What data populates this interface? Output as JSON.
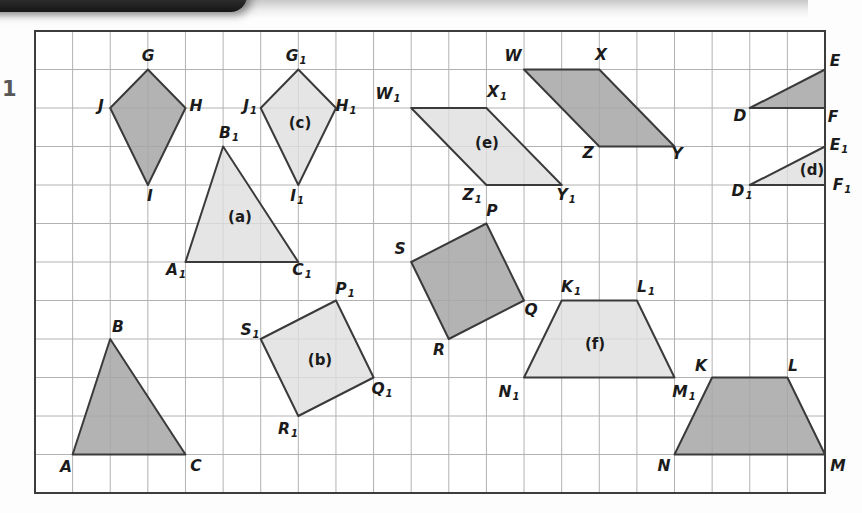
{
  "question_number": "1",
  "figure": {
    "grid": {
      "cols": 21,
      "rows": 12,
      "left": 35,
      "top": 31,
      "cell_w": 37.619,
      "cell_h": 38.5,
      "line_color": "#b2b2b2",
      "border_color": "#3c3c3c",
      "background": "#ffffff"
    },
    "colors": {
      "outline": "#3a3a3a",
      "dark_fill": "#a6a6a6",
      "dark_opacity": 0.85,
      "light_fill": "#dedede",
      "light_opacity": 0.8
    },
    "shapes": [
      {
        "id": "kite-GJHI",
        "kind": "kite",
        "role": "original",
        "fill": "dark",
        "vertices": [
          [
            3,
            1
          ],
          [
            4,
            2
          ],
          [
            3,
            4
          ],
          [
            2,
            2
          ]
        ],
        "vertex_labels": [
          {
            "text": "G",
            "sub": "",
            "x": 148,
            "y": 57
          },
          {
            "text": "H",
            "sub": "",
            "x": 196,
            "y": 107
          },
          {
            "text": "I",
            "sub": "",
            "x": 150,
            "y": 197
          },
          {
            "text": "J",
            "sub": "",
            "x": 101,
            "y": 107
          }
        ],
        "tag": null
      },
      {
        "id": "kite-G1J1H1I1",
        "kind": "kite",
        "role": "image",
        "fill": "light",
        "vertices": [
          [
            7,
            1
          ],
          [
            8,
            2
          ],
          [
            7,
            4
          ],
          [
            6,
            2
          ]
        ],
        "vertex_labels": [
          {
            "text": "G",
            "sub": "1",
            "x": 296,
            "y": 57
          },
          {
            "text": "H",
            "sub": "1",
            "x": 346,
            "y": 107
          },
          {
            "text": "I",
            "sub": "1",
            "x": 297,
            "y": 197
          },
          {
            "text": "J",
            "sub": "1",
            "x": 250,
            "y": 107
          }
        ],
        "tag": {
          "text": "(c)",
          "x": 300,
          "y": 123
        }
      },
      {
        "id": "triangle-ABC",
        "kind": "triangle",
        "role": "original",
        "fill": "dark",
        "vertices": [
          [
            1,
            11
          ],
          [
            2,
            8
          ],
          [
            4,
            11
          ]
        ],
        "vertex_labels": [
          {
            "text": "A",
            "sub": "",
            "x": 66,
            "y": 468
          },
          {
            "text": "B",
            "sub": "",
            "x": 118,
            "y": 328
          },
          {
            "text": "C",
            "sub": "",
            "x": 196,
            "y": 467
          }
        ],
        "tag": null
      },
      {
        "id": "triangle-A1B1C1",
        "kind": "triangle",
        "role": "image",
        "fill": "light",
        "vertices": [
          [
            4,
            6
          ],
          [
            5,
            3
          ],
          [
            7,
            6
          ]
        ],
        "vertex_labels": [
          {
            "text": "A",
            "sub": "1",
            "x": 176,
            "y": 271
          },
          {
            "text": "B",
            "sub": "1",
            "x": 229,
            "y": 134
          },
          {
            "text": "C",
            "sub": "1",
            "x": 302,
            "y": 271
          }
        ],
        "tag": {
          "text": "(a)",
          "x": 240,
          "y": 217
        }
      },
      {
        "id": "square-SPQR",
        "kind": "square",
        "role": "original",
        "fill": "dark",
        "vertices": [
          [
            10,
            6
          ],
          [
            12,
            5
          ],
          [
            13,
            7
          ],
          [
            11,
            8
          ]
        ],
        "vertex_labels": [
          {
            "text": "S",
            "sub": "",
            "x": 400,
            "y": 250
          },
          {
            "text": "P",
            "sub": "",
            "x": 492,
            "y": 212
          },
          {
            "text": "Q",
            "sub": "",
            "x": 531,
            "y": 311
          },
          {
            "text": "R",
            "sub": "",
            "x": 439,
            "y": 351
          }
        ],
        "tag": null
      },
      {
        "id": "square-S1P1Q1R1",
        "kind": "square",
        "role": "image",
        "fill": "light",
        "vertices": [
          [
            6,
            8
          ],
          [
            8,
            7
          ],
          [
            9,
            9
          ],
          [
            7,
            10
          ]
        ],
        "vertex_labels": [
          {
            "text": "S",
            "sub": "1",
            "x": 250,
            "y": 331
          },
          {
            "text": "P",
            "sub": "1",
            "x": 345,
            "y": 290
          },
          {
            "text": "Q",
            "sub": "1",
            "x": 382,
            "y": 390
          },
          {
            "text": "R",
            "sub": "1",
            "x": 288,
            "y": 430
          }
        ],
        "tag": {
          "text": "(b)",
          "x": 320,
          "y": 360
        }
      },
      {
        "id": "parallelogram-WXYZ",
        "kind": "parallelogram",
        "role": "original",
        "fill": "dark",
        "vertices": [
          [
            13,
            1
          ],
          [
            15,
            1
          ],
          [
            17,
            3
          ],
          [
            15,
            3
          ]
        ],
        "vertex_labels": [
          {
            "text": "W",
            "sub": "",
            "x": 513,
            "y": 57
          },
          {
            "text": "X",
            "sub": "",
            "x": 601,
            "y": 56
          },
          {
            "text": "Y",
            "sub": "",
            "x": 677,
            "y": 155
          },
          {
            "text": "Z",
            "sub": "",
            "x": 588,
            "y": 154
          }
        ],
        "tag": null
      },
      {
        "id": "parallelogram-W1X1Y1Z1",
        "kind": "parallelogram",
        "role": "image",
        "fill": "light",
        "vertices": [
          [
            10,
            2
          ],
          [
            12,
            2
          ],
          [
            14,
            4
          ],
          [
            12,
            4
          ]
        ],
        "vertex_labels": [
          {
            "text": "W",
            "sub": "1",
            "x": 388,
            "y": 95
          },
          {
            "text": "X",
            "sub": "1",
            "x": 497,
            "y": 93
          },
          {
            "text": "Y",
            "sub": "1",
            "x": 566,
            "y": 196
          },
          {
            "text": "Z",
            "sub": "1",
            "x": 472,
            "y": 196
          }
        ],
        "tag": {
          "text": "(e)",
          "x": 487,
          "y": 143
        }
      },
      {
        "id": "trapezium-KLMN",
        "kind": "trapezium",
        "role": "original",
        "fill": "dark",
        "vertices": [
          [
            18,
            9
          ],
          [
            20,
            9
          ],
          [
            21,
            11
          ],
          [
            17,
            11
          ]
        ],
        "vertex_labels": [
          {
            "text": "K",
            "sub": "",
            "x": 701,
            "y": 367
          },
          {
            "text": "L",
            "sub": "",
            "x": 793,
            "y": 367
          },
          {
            "text": "M",
            "sub": "",
            "x": 838,
            "y": 467
          },
          {
            "text": "N",
            "sub": "",
            "x": 664,
            "y": 467
          }
        ],
        "tag": null
      },
      {
        "id": "trapezium-K1L1M1N1",
        "kind": "trapezium",
        "role": "image",
        "fill": "light",
        "vertices": [
          [
            14,
            7
          ],
          [
            16,
            7
          ],
          [
            17,
            9
          ],
          [
            13,
            9
          ]
        ],
        "vertex_labels": [
          {
            "text": "K",
            "sub": "1",
            "x": 571,
            "y": 288
          },
          {
            "text": "L",
            "sub": "1",
            "x": 646,
            "y": 288
          },
          {
            "text": "M",
            "sub": "1",
            "x": 684,
            "y": 393
          },
          {
            "text": "N",
            "sub": "1",
            "x": 509,
            "y": 393
          }
        ],
        "tag": {
          "text": "(f)",
          "x": 595,
          "y": 344
        }
      },
      {
        "id": "triangle-DEF",
        "kind": "triangle",
        "role": "original",
        "fill": "dark",
        "vertices": [
          [
            19,
            2
          ],
          [
            21,
            1
          ],
          [
            21,
            2
          ]
        ],
        "vertex_labels": [
          {
            "text": "D",
            "sub": "",
            "x": 740,
            "y": 117
          },
          {
            "text": "E",
            "sub": "",
            "x": 835,
            "y": 62
          },
          {
            "text": "F",
            "sub": "",
            "x": 833,
            "y": 118
          }
        ],
        "tag": null
      },
      {
        "id": "triangle-D1E1F1",
        "kind": "triangle",
        "role": "image",
        "fill": "light",
        "vertices": [
          [
            19,
            4
          ],
          [
            21,
            3
          ],
          [
            21,
            4
          ]
        ],
        "vertex_labels": [
          {
            "text": "D",
            "sub": "1",
            "x": 742,
            "y": 192
          },
          {
            "text": "E",
            "sub": "1",
            "x": 839,
            "y": 146
          },
          {
            "text": "F",
            "sub": "1",
            "x": 842,
            "y": 186
          }
        ],
        "tag": {
          "text": "(d)",
          "x": 812,
          "y": 170
        }
      }
    ]
  }
}
